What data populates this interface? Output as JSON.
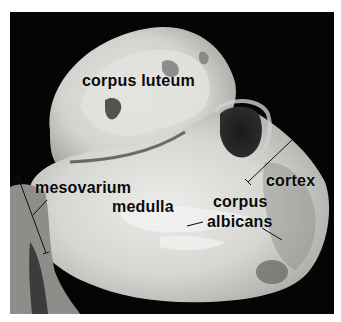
{
  "figure": {
    "background_color": "#050505",
    "border_color": "#ffffff"
  },
  "labels": {
    "corpus_luteum": "corpus luteum",
    "mesovarium": "mesovarium",
    "medulla": "medulla",
    "cortex": "cortex",
    "corpus_albicans_line1": "corpus",
    "corpus_albicans_line2": "albicans"
  }
}
